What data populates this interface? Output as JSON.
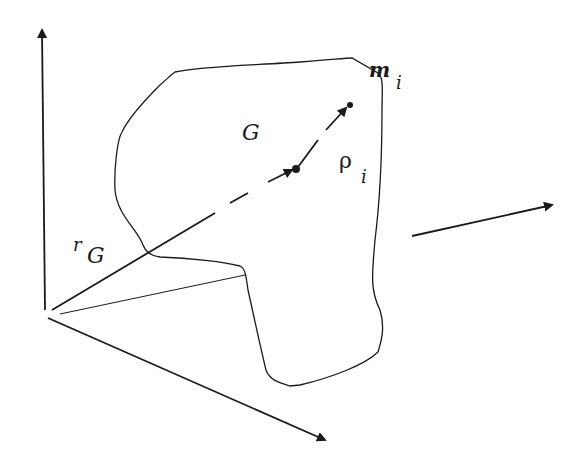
{
  "diagram": {
    "type": "rigid-body-center-of-mass",
    "labels": {
      "center_of_mass": "G",
      "particle_mass": "m",
      "particle_mass_sub": "i",
      "relative_position": "ρ",
      "relative_position_sub": "i",
      "position_vector": "r",
      "position_vector_sub": "G"
    },
    "axes": [
      "z-axis (up)",
      "y-axis (right)",
      "x-axis (down-right)"
    ],
    "colors": {
      "ink": "#1a1a1a",
      "background": "#ffffff"
    }
  }
}
